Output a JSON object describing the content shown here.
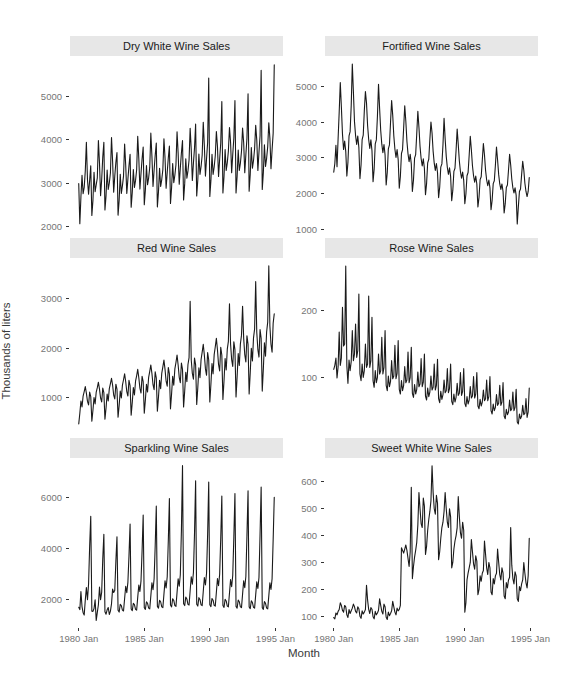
{
  "figure": {
    "y_axis_label": "Thousands of liters",
    "x_axis_label": "Month"
  },
  "style": {
    "line_color": "#1a1a1a",
    "panel_bg": "#ffffff",
    "strip_bg": "#e7e7e7",
    "strip_text": "#1a1a1a",
    "tick_label_color": "#757575",
    "tick_mark_color": "#333333",
    "axis_title_color": "#3a3a3a",
    "grid": "off",
    "legend": "none"
  },
  "x_axis": {
    "label": "Month",
    "tick_labels": [
      "1980 Jan",
      "1985 Jan",
      "1990 Jan",
      "1995 Jan"
    ],
    "tick_month_index": [
      0,
      60,
      120,
      180
    ],
    "start": "1980 Jan",
    "end": "1994 Dec",
    "frequency": "monthly"
  },
  "chart_data": [
    {
      "type": "line",
      "title": "Dry White Wine Sales",
      "ylabel": "Thousands of liters",
      "yticks": [
        2000,
        3000,
        4000,
        5000
      ],
      "ylim": [
        1870,
        5930
      ],
      "x_start": "1980 Jan",
      "x_end": "1994 Dec",
      "values": [
        2985,
        2060,
        2675,
        3180,
        2755,
        2900,
        3280,
        3940,
        3075,
        2740,
        3060,
        3395,
        2250,
        2600,
        3250,
        2800,
        2960,
        3120,
        3980,
        3460,
        2710,
        3080,
        3600,
        3940,
        2380,
        2710,
        3300,
        2850,
        3000,
        3230,
        4050,
        3500,
        2790,
        3160,
        3480,
        3700,
        2260,
        2600,
        3200,
        2760,
        2940,
        3160,
        3900,
        3410,
        2760,
        3090,
        3400,
        3660,
        2440,
        2780,
        3310,
        2900,
        3060,
        3300,
        4080,
        3560,
        2860,
        3220,
        3560,
        3830,
        2500,
        2840,
        3400,
        2960,
        3120,
        3360,
        4150,
        3620,
        2920,
        3300,
        3640,
        3920,
        2450,
        2800,
        3340,
        2920,
        3080,
        3310,
        4020,
        3580,
        2880,
        3250,
        3580,
        3850,
        2530,
        2890,
        3450,
        3010,
        3180,
        3420,
        4180,
        3690,
        2970,
        3350,
        3700,
        3980,
        2610,
        2980,
        3560,
        3110,
        3280,
        3530,
        4260,
        3770,
        3060,
        3460,
        3810,
        4360,
        2700,
        3070,
        3670,
        3200,
        3380,
        3640,
        4400,
        3860,
        3160,
        3560,
        3930,
        5420,
        2690,
        3060,
        3660,
        3200,
        3370,
        3630,
        4190,
        3850,
        3150,
        3550,
        3920,
        4880,
        2770,
        3150,
        3770,
        3290,
        3470,
        3740,
        4280,
        3940,
        3240,
        3660,
        4040,
        4900,
        2770,
        3150,
        3760,
        3290,
        3460,
        3730,
        4270,
        3930,
        3240,
        3650,
        4030,
        5060,
        2810,
        3200,
        3820,
        3340,
        3520,
        3790,
        4330,
        3990,
        3290,
        3710,
        4090,
        5600,
        2850,
        3240,
        3880,
        3380,
        3570,
        3840,
        4390,
        4040,
        3330,
        3760,
        4150,
        5725
      ]
    },
    {
      "type": "line",
      "title": "Fortified Wine Sales",
      "ylabel": "Thousands of liters",
      "yticks": [
        1000,
        2000,
        3000,
        4000,
        5000
      ],
      "ylim": [
        930,
        5840
      ],
      "x_start": "1980 Jan",
      "x_end": "1994 Dec",
      "values": [
        2600,
        2840,
        3350,
        2750,
        3540,
        4280,
        5100,
        4420,
        3660,
        3230,
        3470,
        3180,
        2490,
        2880,
        3610,
        3730,
        4460,
        5618,
        4840,
        4010,
        3620,
        3370,
        3610,
        3290,
        2420,
        2800,
        3510,
        3630,
        4310,
        4850,
        4530,
        3900,
        3510,
        3260,
        3500,
        3200,
        2330,
        2690,
        3390,
        3500,
        4160,
        5050,
        4370,
        3760,
        3380,
        3140,
        3370,
        3080,
        2240,
        2590,
        3250,
        3360,
        3990,
        4600,
        4190,
        3610,
        3240,
        3010,
        3230,
        2950,
        2150,
        2480,
        3120,
        3230,
        3830,
        4450,
        4020,
        3460,
        3110,
        2890,
        3100,
        2830,
        2060,
        2380,
        2990,
        3090,
        3670,
        4300,
        3850,
        3320,
        2980,
        2770,
        2970,
        2710,
        1970,
        2280,
        2860,
        2960,
        3510,
        4000,
        3690,
        3180,
        2850,
        2650,
        2840,
        2590,
        1890,
        2180,
        2740,
        2830,
        3360,
        4100,
        3530,
        3040,
        2730,
        2540,
        2720,
        2480,
        1800,
        2090,
        2620,
        2710,
        3210,
        3800,
        3370,
        2910,
        2610,
        2430,
        2600,
        2370,
        1720,
        1990,
        2500,
        2590,
        3070,
        3600,
        3220,
        2780,
        2500,
        2320,
        2490,
        2270,
        1630,
        1900,
        2390,
        2470,
        2930,
        3400,
        3080,
        2650,
        2380,
        2220,
        2380,
        2160,
        1550,
        1810,
        2280,
        2360,
        2790,
        3300,
        2940,
        2530,
        2270,
        2120,
        2270,
        2060,
        1460,
        1720,
        2170,
        2240,
        2660,
        3100,
        2800,
        2410,
        2160,
        2020,
        2160,
        1960,
        1154,
        1630,
        2060,
        2130,
        2530,
        2900,
        2660,
        2290,
        2060,
        1920,
        2060,
        2450
      ]
    },
    {
      "type": "line",
      "title": "Red Wine Sales",
      "ylabel": "Thousands of liters",
      "yticks": [
        1000,
        2000,
        3000
      ],
      "ylim": [
        300,
        3830
      ],
      "x_start": "1980 Jan",
      "x_end": "1994 Dec",
      "values": [
        464,
        680,
        930,
        810,
        1030,
        1120,
        1220,
        1090,
        920,
        850,
        1110,
        1020,
        520,
        740,
        1000,
        870,
        1110,
        1200,
        1310,
        1170,
        990,
        910,
        1190,
        1100,
        560,
        790,
        1070,
        930,
        1180,
        1280,
        1390,
        1250,
        1050,
        970,
        1270,
        1170,
        600,
        840,
        1130,
        990,
        1250,
        1360,
        1480,
        1320,
        1120,
        1030,
        1350,
        1240,
        640,
        900,
        1200,
        1050,
        1330,
        1440,
        1570,
        1400,
        1190,
        1090,
        1430,
        1320,
        680,
        950,
        1270,
        1110,
        1410,
        1530,
        1660,
        1490,
        1260,
        1160,
        1520,
        1400,
        720,
        1010,
        1350,
        1180,
        1490,
        1620,
        1760,
        1570,
        1330,
        1230,
        1610,
        1480,
        770,
        1070,
        1430,
        1250,
        1580,
        1710,
        1860,
        1660,
        1410,
        1300,
        1700,
        1570,
        810,
        1130,
        1510,
        1320,
        1670,
        1810,
        2950,
        1760,
        1490,
        1370,
        1800,
        1660,
        860,
        1200,
        1600,
        1400,
        1770,
        1920,
        2080,
        1860,
        1580,
        1450,
        1910,
        1760,
        910,
        1270,
        1690,
        1480,
        1870,
        2030,
        2200,
        1970,
        1670,
        1540,
        2020,
        1860,
        960,
        1340,
        1790,
        1560,
        1980,
        2140,
        2900,
        2080,
        1770,
        1630,
        2130,
        1970,
        1010,
        1420,
        1890,
        1650,
        2090,
        2260,
        2850,
        2200,
        1870,
        1720,
        2250,
        2080,
        1070,
        1500,
        2000,
        1740,
        2210,
        2390,
        3350,
        2320,
        1970,
        1820,
        2380,
        2200,
        1130,
        1580,
        2110,
        1840,
        2330,
        2530,
        3670,
        2450,
        2080,
        1920,
        2510,
        2700
      ]
    },
    {
      "type": "line",
      "title": "Rose Wine Sales",
      "ylabel": "Thousands of liters",
      "yticks": [
        100,
        200
      ],
      "ylim": [
        18,
        279
      ],
      "x_start": "1980 Jan",
      "x_end": "1994 Dec",
      "values": [
        112,
        118,
        129,
        99,
        116,
        168,
        118,
        129,
        205,
        147,
        150,
        267,
        117,
        91,
        126,
        110,
        124,
        170,
        125,
        135,
        180,
        130,
        140,
        225,
        105,
        95,
        120,
        100,
        110,
        150,
        115,
        120,
        222,
        115,
        125,
        190,
        95,
        85,
        110,
        92,
        100,
        135,
        105,
        110,
        160,
        105,
        115,
        170,
        88,
        80,
        102,
        86,
        94,
        125,
        98,
        102,
        148,
        98,
        106,
        155,
        82,
        75,
        95,
        80,
        88,
        116,
        92,
        96,
        138,
        92,
        100,
        145,
        76,
        70,
        89,
        75,
        82,
        108,
        86,
        90,
        128,
        86,
        93,
        135,
        72,
        66,
        84,
        71,
        78,
        102,
        81,
        85,
        120,
        81,
        88,
        127,
        68,
        62,
        79,
        67,
        74,
        96,
        77,
        80,
        113,
        77,
        83,
        120,
        64,
        59,
        75,
        63,
        70,
        91,
        73,
        76,
        107,
        73,
        79,
        113,
        61,
        56,
        71,
        60,
        66,
        86,
        69,
        72,
        101,
        69,
        75,
        107,
        57,
        53,
        67,
        57,
        63,
        81,
        65,
        68,
        96,
        65,
        71,
        101,
        50,
        45,
        60,
        50,
        55,
        74,
        58,
        61,
        88,
        58,
        63,
        92,
        42,
        38,
        52,
        44,
        48,
        66,
        50,
        53,
        78,
        50,
        55,
        82,
        33,
        30,
        45,
        38,
        42,
        58,
        44,
        46,
        68,
        40,
        48,
        84
      ]
    },
    {
      "type": "line",
      "title": "Sparkling Wine Sales",
      "ylabel": "Thousands of liters",
      "yticks": [
        2000,
        4000,
        6000
      ],
      "ylim": [
        870,
        7540
      ],
      "x_start": "1980 Jan",
      "x_end": "1994 Dec",
      "values": [
        1686,
        1591,
        2304,
        1712,
        1471,
        1377,
        1966,
        2453,
        1984,
        2596,
        4087,
        5250,
        1530,
        1523,
        1633,
        1976,
        1170,
        1480,
        1781,
        2472,
        1981,
        2273,
        3600,
        4550,
        1510,
        1413,
        1583,
        1675,
        1401,
        1535,
        1819,
        2394,
        2261,
        2351,
        3500,
        4450,
        1570,
        1495,
        1800,
        1751,
        1571,
        1537,
        2030,
        2506,
        2256,
        2662,
        3700,
        4950,
        1620,
        1550,
        1840,
        1790,
        1600,
        1570,
        2070,
        2560,
        2300,
        2720,
        3900,
        5300,
        1670,
        1600,
        1900,
        1840,
        1650,
        1620,
        2130,
        2640,
        2370,
        2800,
        4100,
        5650,
        1720,
        1650,
        1960,
        1900,
        1700,
        1670,
        2200,
        2720,
        2440,
        2880,
        4300,
        5950,
        1770,
        1700,
        2020,
        1950,
        1750,
        1720,
        2260,
        2800,
        2510,
        2960,
        4700,
        7242,
        1820,
        1750,
        2080,
        2010,
        1800,
        1770,
        2330,
        2880,
        2590,
        3050,
        4600,
        6650,
        1800,
        1730,
        2060,
        1990,
        1780,
        1750,
        2300,
        2850,
        2560,
        3020,
        4550,
        6600,
        1780,
        1710,
        2030,
        1960,
        1760,
        1730,
        2270,
        2810,
        2530,
        2980,
        4400,
        6050,
        1750,
        1680,
        2000,
        1930,
        1730,
        1700,
        2240,
        2770,
        2490,
        2940,
        4450,
        6150,
        1720,
        1650,
        1970,
        1900,
        1700,
        1670,
        2200,
        2720,
        2450,
        2890,
        4500,
        6250,
        1700,
        1630,
        1940,
        1870,
        1680,
        1650,
        2170,
        2680,
        2420,
        2850,
        4550,
        6400,
        1670,
        1600,
        1910,
        1840,
        1650,
        1620,
        2130,
        2640,
        2380,
        2800,
        4350,
        5999
      ]
    },
    {
      "type": "line",
      "title": "Sweet White Wine Sales",
      "ylabel": "Thousands of liters",
      "yticks": [
        100,
        200,
        300,
        400,
        500,
        600
      ],
      "ylim": [
        56,
        689
      ],
      "x_start": "1980 Jan",
      "x_end": "1994 Dec",
      "values": [
        95,
        90,
        112,
        105,
        118,
        125,
        150,
        140,
        122,
        115,
        140,
        135,
        105,
        95,
        125,
        110,
        120,
        130,
        145,
        135,
        118,
        112,
        135,
        128,
        100,
        92,
        120,
        108,
        115,
        125,
        215,
        160,
        125,
        110,
        132,
        126,
        98,
        90,
        118,
        105,
        112,
        122,
        165,
        140,
        118,
        108,
        145,
        135,
        96,
        88,
        115,
        102,
        110,
        120,
        155,
        135,
        115,
        105,
        130,
        120,
        125,
        140,
        355,
        345,
        335,
        350,
        365,
        345,
        315,
        285,
        340,
        580,
        240,
        285,
        320,
        345,
        375,
        440,
        560,
        500,
        445,
        430,
        540,
        510,
        330,
        360,
        420,
        460,
        490,
        530,
        660,
        560,
        500,
        480,
        550,
        520,
        310,
        340,
        390,
        430,
        450,
        490,
        560,
        500,
        450,
        430,
        500,
        470,
        280,
        300,
        350,
        380,
        400,
        430,
        545,
        470,
        410,
        390,
        450,
        420,
        115,
        150,
        235,
        260,
        280,
        300,
        385,
        340,
        295,
        275,
        325,
        305,
        180,
        200,
        250,
        230,
        260,
        270,
        380,
        330,
        280,
        255,
        300,
        280,
        190,
        180,
        240,
        220,
        250,
        260,
        350,
        300,
        255,
        235,
        280,
        260,
        175,
        165,
        225,
        205,
        235,
        245,
        430,
        290,
        240,
        220,
        265,
        250,
        165,
        155,
        210,
        195,
        220,
        235,
        300,
        260,
        225,
        205,
        250,
        390
      ]
    }
  ]
}
